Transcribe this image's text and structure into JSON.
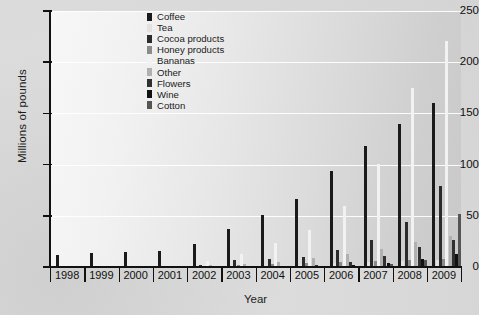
{
  "chart_data": {
    "type": "bar",
    "title": "",
    "xlabel": "Year",
    "ylabel": "Millions of pounds",
    "ylim": [
      0,
      250
    ],
    "yticks": [
      0,
      50,
      100,
      150,
      200,
      250
    ],
    "grid": true,
    "legend_position": "top-center",
    "categories": [
      "1998",
      "1999",
      "2000",
      "2001",
      "2002",
      "2003",
      "2004",
      "2005",
      "2006",
      "2007",
      "2008",
      "2009"
    ],
    "series": [
      {
        "name": "Coffee",
        "color": "#1a1a1a",
        "values": [
          12,
          14,
          15,
          16,
          22,
          37,
          51,
          66,
          94,
          118,
          140,
          160
        ]
      },
      {
        "name": "Tea",
        "color": "#e2e2e2",
        "values": [
          0,
          0,
          0,
          0,
          0.5,
          1,
          2,
          3,
          4,
          5,
          6,
          7
        ]
      },
      {
        "name": "Cocoa products",
        "color": "#2b2b2b",
        "values": [
          0,
          0,
          0,
          1,
          2,
          7,
          8,
          10,
          17,
          26,
          44,
          79
        ]
      },
      {
        "name": "Honey products",
        "color": "#8c8c8c",
        "values": [
          0,
          0,
          0,
          0,
          1,
          2,
          3,
          4,
          5,
          6,
          7,
          8
        ]
      },
      {
        "name": "Bananas",
        "color": "#f2f2f2",
        "values": [
          0,
          0,
          0,
          0,
          6,
          13,
          23,
          36,
          60,
          101,
          175,
          221
        ]
      },
      {
        "name": "Other",
        "color": "#b0b0b0",
        "values": [
          0,
          0,
          0,
          0,
          2,
          3,
          5,
          9,
          13,
          18,
          24,
          30
        ]
      },
      {
        "name": "Flowers",
        "color": "#303030",
        "values": [
          0,
          0,
          0,
          0,
          0,
          0,
          0,
          2,
          5,
          11,
          20,
          26
        ]
      },
      {
        "name": "Wine",
        "color": "#111111",
        "values": [
          0,
          0,
          0,
          0,
          0,
          0,
          0,
          0,
          2,
          4,
          8,
          13
        ]
      },
      {
        "name": "Cotton",
        "color": "#555555",
        "values": [
          0,
          0,
          0,
          0,
          0,
          0,
          0,
          0,
          1,
          3,
          7,
          52
        ]
      }
    ]
  },
  "legend": {
    "items": [
      {
        "label": "Coffee"
      },
      {
        "label": "Tea"
      },
      {
        "label": "Cocoa products"
      },
      {
        "label": "Honey products"
      },
      {
        "label": "Bananas"
      },
      {
        "label": "Other"
      },
      {
        "label": "Flowers"
      },
      {
        "label": "Wine"
      },
      {
        "label": "Cotton"
      }
    ]
  },
  "colors": {
    "axis": "#111111",
    "gridline": "#ffffff",
    "plot_background_light": "#f7f7f7",
    "plot_background_dark": "#c9c9c9",
    "page_background": "#d7d7d7"
  }
}
